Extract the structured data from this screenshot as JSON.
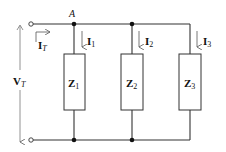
{
  "diagram": {
    "type": "parallel-impedance-circuit",
    "node_label": "A",
    "total_current": {
      "symbol": "I",
      "subscript": "T"
    },
    "total_voltage": {
      "symbol": "V",
      "subscript": "T"
    },
    "branches": [
      {
        "impedance": {
          "symbol": "Z",
          "subscript": "1"
        },
        "current": {
          "symbol": "I",
          "subscript": "1"
        }
      },
      {
        "impedance": {
          "symbol": "Z",
          "subscript": "2"
        },
        "current": {
          "symbol": "I",
          "subscript": "2"
        }
      },
      {
        "impedance": {
          "symbol": "Z",
          "subscript": "3"
        },
        "current": {
          "symbol": "I",
          "subscript": "3"
        }
      }
    ],
    "colors": {
      "wire": "#333333",
      "arrow": "#555555",
      "text": "#111111",
      "background": "#ffffff"
    }
  }
}
